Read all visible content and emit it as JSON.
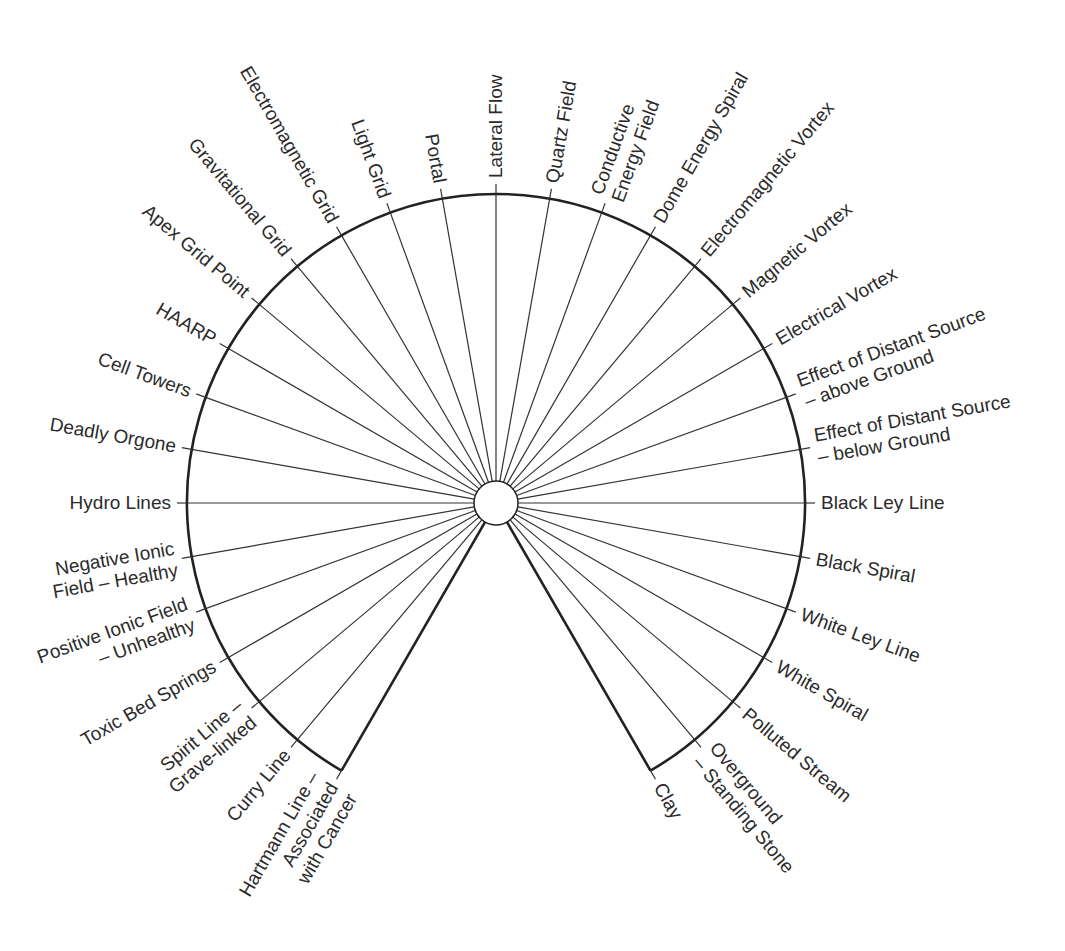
{
  "diagram": {
    "type": "radial-pendulum-chart",
    "center": [
      496,
      503
    ],
    "radius": 309,
    "hub_radius": 22,
    "tick_length": 10,
    "start_angle_deg": -150,
    "end_angle_deg": 150,
    "step_deg": 10,
    "colors": {
      "line": "#222222",
      "text": "#2b2b2b",
      "background": "#ffffff"
    },
    "spokes": [
      {
        "angle": -150,
        "lines": [
          "Hartmann Line –",
          "Associated",
          "with Cancer"
        ]
      },
      {
        "angle": -140,
        "lines": [
          "Curry Line"
        ]
      },
      {
        "angle": -130,
        "lines": [
          "Spirit Line –",
          "Grave-linked"
        ]
      },
      {
        "angle": -120,
        "lines": [
          "Toxic Bed Springs"
        ]
      },
      {
        "angle": -110,
        "lines": [
          "Positive Ionic Field",
          "– Unhealthy"
        ]
      },
      {
        "angle": -100,
        "lines": [
          "Negative Ionic",
          "Field – Healthy"
        ]
      },
      {
        "angle": -90,
        "lines": [
          "Hydro Lines"
        ]
      },
      {
        "angle": -80,
        "lines": [
          "Deadly Orgone"
        ]
      },
      {
        "angle": -70,
        "lines": [
          "Cell Towers"
        ]
      },
      {
        "angle": -60,
        "lines": [
          "HAARP"
        ]
      },
      {
        "angle": -50,
        "lines": [
          "Apex Grid Point"
        ]
      },
      {
        "angle": -40,
        "lines": [
          "Gravitational Grid"
        ]
      },
      {
        "angle": -30,
        "lines": [
          "Electromagnetic Grid"
        ]
      },
      {
        "angle": -20,
        "lines": [
          "Light Grid"
        ]
      },
      {
        "angle": -10,
        "lines": [
          "Portal"
        ]
      },
      {
        "angle": 0,
        "lines": [
          "Lateral Flow"
        ]
      },
      {
        "angle": 10,
        "lines": [
          "Quartz Field"
        ]
      },
      {
        "angle": 20,
        "lines": [
          "Conductive",
          "Energy Field"
        ]
      },
      {
        "angle": 30,
        "lines": [
          "Dome Energy Spiral"
        ]
      },
      {
        "angle": 40,
        "lines": [
          "Electromagnetic Vortex"
        ]
      },
      {
        "angle": 50,
        "lines": [
          "Magnetic Vortex"
        ]
      },
      {
        "angle": 60,
        "lines": [
          "Electrical Vortex"
        ]
      },
      {
        "angle": 70,
        "lines": [
          "Effect of Distant Source",
          "– above Ground"
        ]
      },
      {
        "angle": 80,
        "lines": [
          "Effect of Distant Source",
          "– below Ground"
        ]
      },
      {
        "angle": 90,
        "lines": [
          "Black Ley Line"
        ]
      },
      {
        "angle": 100,
        "lines": [
          "Black Spiral"
        ]
      },
      {
        "angle": 110,
        "lines": [
          "White Ley Line"
        ]
      },
      {
        "angle": 120,
        "lines": [
          "White Spiral"
        ]
      },
      {
        "angle": 130,
        "lines": [
          "Polluted Stream"
        ]
      },
      {
        "angle": 140,
        "lines": [
          "Overground",
          "– Standing Stone"
        ]
      },
      {
        "angle": 150,
        "lines": [
          "Clay"
        ]
      }
    ]
  }
}
